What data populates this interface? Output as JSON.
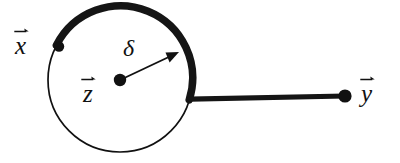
{
  "figure": {
    "type": "geometric-diagram",
    "background_color": "#ffffff",
    "stroke_color": "#111111",
    "width": 400,
    "height": 163,
    "labels": {
      "x_vector": "x",
      "z_vector": "z",
      "y_vector": "y",
      "delta": "δ"
    },
    "elements": {
      "circle": {
        "center_x": 120,
        "center_y": 80,
        "radius": 72,
        "thin_stroke_width": 1.6
      },
      "thick_arc": {
        "start_angle_deg": 208,
        "end_angle_deg": 16,
        "stroke_width": 7
      },
      "radius_arrow": {
        "from_x": 120,
        "from_y": 80,
        "to_x": 177,
        "to_y": 53,
        "stroke_width": 1.8
      },
      "segment_to_y": {
        "from_x": 192,
        "from_y": 99,
        "to_x": 345,
        "to_y": 96,
        "stroke_width": 5
      },
      "point_x": {
        "cx": 59,
        "cy": 46,
        "r": 5
      },
      "point_z": {
        "cx": 120,
        "cy": 80,
        "r": 6
      },
      "point_y": {
        "cx": 345,
        "cy": 96,
        "r": 6.5
      }
    }
  }
}
